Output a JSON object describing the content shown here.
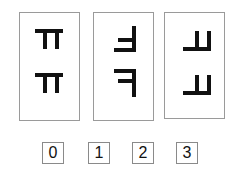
{
  "puzzle": {
    "panels": [
      {
        "index": 1,
        "figures": [
          {
            "shape": "F",
            "rotation": "90cw"
          },
          {
            "shape": "F",
            "rotation": "90cw"
          }
        ]
      },
      {
        "index": 2,
        "figures": [
          {
            "shape": "F",
            "rotation": "180"
          },
          {
            "shape": "F",
            "rotation": "mirrored"
          }
        ]
      },
      {
        "index": 3,
        "figures": [
          {
            "shape": "F",
            "rotation": "90ccw"
          },
          {
            "shape": "F",
            "rotation": "90ccw"
          }
        ]
      }
    ],
    "answer_options": [
      {
        "label": "0"
      },
      {
        "label": "1"
      },
      {
        "label": "2"
      },
      {
        "label": "3"
      }
    ],
    "colors": {
      "stroke": "#111111",
      "border": "#9a9a9a"
    }
  }
}
